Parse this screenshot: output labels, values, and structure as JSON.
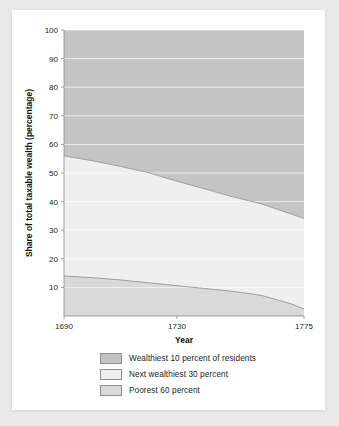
{
  "chart_data": {
    "type": "area",
    "title": "",
    "xlabel": "Year",
    "ylabel": "Share of total taxable wealth (percentage)",
    "stacked": true,
    "stack_total": 100,
    "xlim": [
      1690,
      1775
    ],
    "ylim": [
      0,
      100
    ],
    "xticks": [
      1690,
      1730,
      1775
    ],
    "xtick_labels": [
      "1690",
      "1730",
      "1775"
    ],
    "yticks": [
      10,
      20,
      30,
      40,
      50,
      60,
      70,
      80,
      90,
      100
    ],
    "ytick_labels": [
      "10",
      "20",
      "30",
      "40",
      "50",
      "60",
      "70",
      "80",
      "90",
      "100"
    ],
    "grid": true,
    "grid_color": "#ffffff",
    "legend_position": "bottom",
    "x": [
      1690,
      1700,
      1710,
      1720,
      1730,
      1740,
      1750,
      1760,
      1770,
      1775
    ],
    "series": [
      {
        "name": "Poorest 60 percent",
        "color": "#d9d9d9",
        "values": [
          14.0,
          13.4,
          12.6,
          11.6,
          10.6,
          9.6,
          8.6,
          7.2,
          4.4,
          2.5
        ]
      },
      {
        "name": "Next wealthiest 30 percent",
        "color": "#efefef",
        "values": [
          42.0,
          40.9,
          39.7,
          38.5,
          36.5,
          34.8,
          33.0,
          32.0,
          31.4,
          31.6
        ]
      },
      {
        "name": "Wealthiest 10 percent of residents",
        "color": "#c4c4c4",
        "values": [
          44.0,
          45.7,
          47.7,
          49.9,
          52.9,
          55.6,
          58.4,
          60.8,
          64.2,
          65.9
        ]
      }
    ],
    "cumulative_boundaries": {
      "poorest_60_top": [
        14.0,
        13.4,
        12.6,
        11.6,
        10.6,
        9.6,
        8.6,
        7.2,
        4.4,
        2.5
      ],
      "next_30_top": [
        56.0,
        54.3,
        52.3,
        50.1,
        47.1,
        44.4,
        41.6,
        39.2,
        35.8,
        34.1
      ]
    }
  },
  "legend": {
    "items": [
      {
        "label": "Wealthiest 10 percent of residents",
        "color": "#c4c4c4"
      },
      {
        "label": "Next wealthiest 30 percent",
        "color": "#efefef"
      },
      {
        "label": "Poorest 60 percent",
        "color": "#d9d9d9"
      }
    ]
  }
}
